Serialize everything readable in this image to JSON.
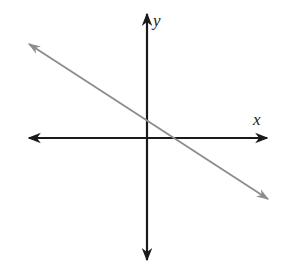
{
  "diagram": {
    "type": "coordinate-plane-with-line",
    "axes": {
      "x_label": "x",
      "y_label": "y",
      "color": "#1a1a1a"
    },
    "line": {
      "description": "straight line with negative slope, positive y-intercept, positive x-intercept",
      "color": "#8c8c8c",
      "slope_sign": "negative",
      "y_intercept_sign": "positive",
      "x_intercept_sign": "positive"
    }
  }
}
